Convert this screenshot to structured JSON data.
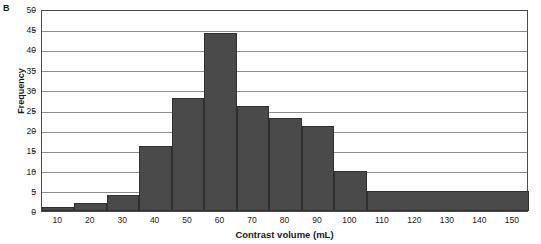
{
  "panel": {
    "letter": "B"
  },
  "chart_data": {
    "type": "bar",
    "title": "",
    "subtitle": "",
    "xlabel": "Contrast volume (mL)",
    "ylabel": "Frequency",
    "xlim": [
      5,
      155
    ],
    "ylim": [
      0,
      50
    ],
    "grid": true,
    "legend": null,
    "bar_style": "histogram",
    "xtick_labels": [
      "10",
      "20",
      "30",
      "40",
      "50",
      "60",
      "70",
      "80",
      "90",
      "100",
      "110",
      "120",
      "130",
      "140",
      "150"
    ],
    "xticks": [
      10,
      20,
      30,
      40,
      50,
      60,
      70,
      80,
      90,
      100,
      110,
      120,
      130,
      140,
      150
    ],
    "ytick_labels": [
      "0",
      "5",
      "10",
      "15",
      "20",
      "25",
      "30",
      "35",
      "40",
      "45",
      "50"
    ],
    "yticks": [
      0,
      5,
      10,
      15,
      20,
      25,
      30,
      35,
      40,
      45,
      50
    ],
    "categories": [
      "10",
      "20",
      "30",
      "40",
      "50",
      "60",
      "70",
      "80",
      "90",
      "100",
      "110-150"
    ],
    "values": [
      1,
      2,
      4,
      16,
      28,
      44,
      26,
      23,
      21,
      10,
      5
    ],
    "bins": [
      {
        "label": "10",
        "bin_start": 5,
        "bin_end": 15,
        "value": 1
      },
      {
        "label": "20",
        "bin_start": 15,
        "bin_end": 25,
        "value": 2
      },
      {
        "label": "30",
        "bin_start": 25,
        "bin_end": 35,
        "value": 4
      },
      {
        "label": "40",
        "bin_start": 35,
        "bin_end": 45,
        "value": 16
      },
      {
        "label": "50",
        "bin_start": 45,
        "bin_end": 55,
        "value": 28
      },
      {
        "label": "60",
        "bin_start": 55,
        "bin_end": 65,
        "value": 44
      },
      {
        "label": "70",
        "bin_start": 65,
        "bin_end": 75,
        "value": 26
      },
      {
        "label": "80",
        "bin_start": 75,
        "bin_end": 85,
        "value": 23
      },
      {
        "label": "90",
        "bin_start": 85,
        "bin_end": 95,
        "value": 21
      },
      {
        "label": "100",
        "bin_start": 95,
        "bin_end": 105,
        "value": 10
      },
      {
        "label": "110-150",
        "bin_start": 105,
        "bin_end": 155,
        "value": 5
      }
    ],
    "colors": {
      "bar_fill": "#4a4a4a",
      "bar_edge": "#303030",
      "grid": "#8c8c8c",
      "frame": "#4a4a4a",
      "text": "#1a1a1a"
    }
  }
}
